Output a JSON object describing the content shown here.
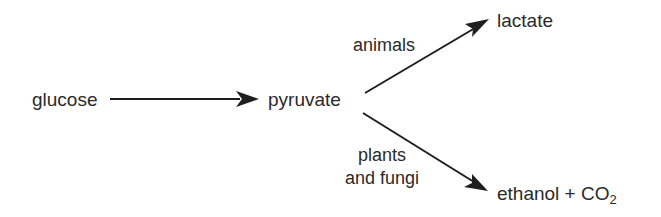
{
  "diagram": {
    "nodes": {
      "glucose": "glucose",
      "pyruvate": "pyruvate",
      "lactate": "lactate",
      "ethanol": "ethanol + CO",
      "ethanol_sub": "2"
    },
    "edges": [
      {
        "from": "glucose",
        "to": "pyruvate",
        "label": ""
      },
      {
        "from": "pyruvate",
        "to": "lactate",
        "label": "animals"
      },
      {
        "from": "pyruvate",
        "to": "ethanol + CO2",
        "label_line1": "plants",
        "label_line2": "and fungi"
      }
    ],
    "labels": {
      "animals": "animals",
      "plants": "plants",
      "and_fungi": "and fungi"
    },
    "colors": {
      "ink": "#2a2a2a",
      "background": "#ffffff"
    }
  }
}
